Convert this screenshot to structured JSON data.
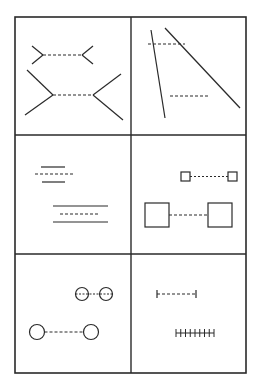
{
  "figure": {
    "title": "",
    "stroke_color": "#2a2a2a",
    "background": "#ffffff",
    "frame": {
      "x": 15,
      "y": 17,
      "width": 231,
      "height": 356
    },
    "dividers": {
      "vertical_x": 131,
      "horizontal_y": [
        135,
        254
      ]
    },
    "panels": [
      {
        "id": "muller-lyer",
        "label": "Müller-Lyer illusion"
      },
      {
        "id": "poggendorff-like",
        "label": "Oblique lines with dashed segments"
      },
      {
        "id": "line-spacing",
        "label": "Parallel lines with dashed centers"
      },
      {
        "id": "squares",
        "label": "Squares connected by dashed lines"
      },
      {
        "id": "circles",
        "label": "Circles connected by dashed lines"
      },
      {
        "id": "ticks",
        "label": "Segments with end ticks vs filled ticks"
      }
    ]
  }
}
